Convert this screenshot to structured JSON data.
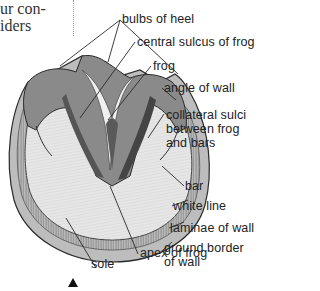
{
  "body_text": {
    "line1": "ur con-",
    "line2": "iders"
  },
  "diagram": {
    "labels": [
      {
        "id": "bulbs_of_heel",
        "text": "bulbs of heel"
      },
      {
        "id": "central_sulcus",
        "text": "central sulcus of frog"
      },
      {
        "id": "frog",
        "text": "frog"
      },
      {
        "id": "angle_of_wall",
        "text": "angle of wall"
      },
      {
        "id": "collateral_sulci",
        "lines": [
          "collateral sulci",
          "between frog",
          "and bars"
        ]
      },
      {
        "id": "bar",
        "text": "bar"
      },
      {
        "id": "white_line",
        "text": "white line"
      },
      {
        "id": "laminae",
        "text": "laminae of wall"
      },
      {
        "id": "ground_border",
        "lines": [
          "ground border",
          "of wall"
        ]
      },
      {
        "id": "apex_of_frog",
        "text": "apex of frog"
      },
      {
        "id": "sole",
        "text": "sole"
      }
    ],
    "marker": "triangle-up"
  },
  "colors": {
    "outline": "#2a2a2a",
    "wall_fill": "#b9b9b9",
    "sole_fill": "#e4e4e4",
    "frog_dark": "#6e6e6e",
    "text": "#222222"
  }
}
